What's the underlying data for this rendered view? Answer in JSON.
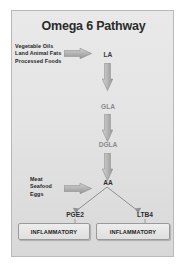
{
  "diagram": {
    "title": "Omega 6 Pathway",
    "type": "metabolic-pathway-flowchart",
    "sources": [
      {
        "id": "dietary-sources-la",
        "lines": [
          "Vegetable Oils",
          "Land Animal Fats",
          "Processed Foods"
        ],
        "feeds_into": "LA"
      },
      {
        "id": "dietary-sources-aa",
        "lines": [
          "Meat",
          "Seafood",
          "Eggs"
        ],
        "feeds_into": "AA"
      }
    ],
    "nodes": [
      {
        "id": "la",
        "label": "LA"
      },
      {
        "id": "gla",
        "label": "GLA"
      },
      {
        "id": "dgla",
        "label": "DGLA"
      },
      {
        "id": "aa",
        "label": "AA"
      },
      {
        "id": "pge2",
        "label": "PGE2"
      },
      {
        "id": "ltb4",
        "label": "LTB4"
      }
    ],
    "outcomes": [
      {
        "id": "pge2-outcome",
        "label": "INFLAMMATORY",
        "from": "PGE2"
      },
      {
        "id": "ltb4-outcome",
        "label": "INFLAMMATORY",
        "from": "LTB4"
      }
    ],
    "edges": [
      {
        "from": "dietary-sources-la",
        "to": "LA",
        "style": "block-arrow-right"
      },
      {
        "from": "LA",
        "to": "GLA",
        "style": "block-arrow-down"
      },
      {
        "from": "GLA",
        "to": "DGLA",
        "style": "block-arrow-down"
      },
      {
        "from": "DGLA",
        "to": "AA",
        "style": "block-arrow-down"
      },
      {
        "from": "dietary-sources-aa",
        "to": "AA",
        "style": "block-arrow-right"
      },
      {
        "from": "AA",
        "to": "PGE2",
        "style": "thin-line-arrow"
      },
      {
        "from": "AA",
        "to": "LTB4",
        "style": "thin-line-arrow"
      },
      {
        "from": "PGE2",
        "to": "pge2-outcome",
        "style": "thin-line-arrow"
      },
      {
        "from": "LTB4",
        "to": "ltb4-outcome",
        "style": "thin-line-arrow"
      }
    ],
    "colors": {
      "background": "#e4e4e4",
      "frame_border": "#b9b9b9",
      "arrow_fill": "#b0b0b0",
      "arrow_edge": "#8d8d8d",
      "title_text": "#2b2b2b",
      "node_text": "#3b3b3b",
      "box_border": "#9a9a9a"
    }
  }
}
